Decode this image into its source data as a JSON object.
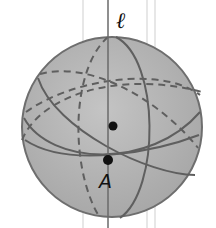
{
  "diagram": {
    "type": "sphere-great-circles",
    "line_label": "ℓ",
    "point_label": "A",
    "colors": {
      "sphere_fill": "#b4b4b4",
      "sphere_stroke": "#6e6e6e",
      "circle_stroke": "#5f5f5f",
      "guide_lines": "#c8c8c8",
      "point": "#111111"
    },
    "points": [
      {
        "name": "center",
        "x": 113,
        "y": 126
      },
      {
        "name": "A",
        "x": 108,
        "y": 160
      }
    ]
  }
}
